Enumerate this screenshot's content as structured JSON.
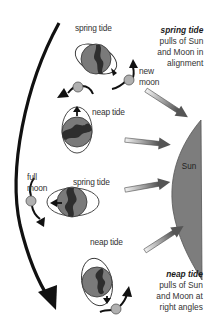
{
  "diagram": {
    "orbit_labels": [
      {
        "id": "spring-top",
        "text": "spring tide"
      },
      {
        "id": "neap-upper",
        "text": "neap tide"
      },
      {
        "id": "spring-middle",
        "text": "spring tide"
      },
      {
        "id": "neap-lower",
        "text": "neap tide"
      }
    ],
    "moon_phase_labels": {
      "new_moon_line1": "new",
      "new_moon_line2": "moon",
      "full_moon_line1": "full",
      "full_moon_line2": "moon"
    },
    "sun_label": "Sun",
    "notes": {
      "spring": {
        "title": "spring tide",
        "line1": "pulls of Sun",
        "line2": "and Moon in",
        "line3": "alignment"
      },
      "neap": {
        "title": "neap tide",
        "line1": "pulls of Sun",
        "line2": "and Moon at",
        "line3": "right angles"
      }
    },
    "colors": {
      "earth": "#7a7a7a",
      "land": "#2e2e2e",
      "moon": "#b0b0b0",
      "sun": "#7d7d7d",
      "arrow": "#1a1a1a",
      "ray_light": "#e6e6e6",
      "ray_dark": "#555555"
    }
  }
}
